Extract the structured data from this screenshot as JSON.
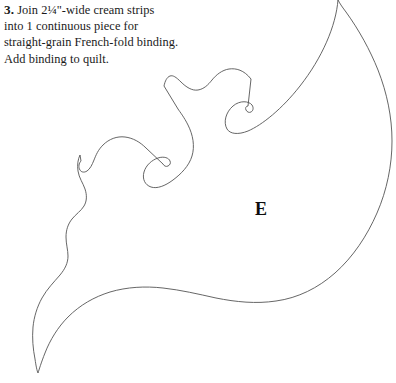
{
  "page": {
    "background_color": "#ffffff",
    "width": 396,
    "height": 383
  },
  "instructions": {
    "step_number": "3.",
    "lines": [
      " Join 2¼\"-wide cream strips",
      "into 1 continuous piece for",
      "straight-grain French-fold binding.",
      "Add binding to quilt."
    ],
    "full_text": "3. Join 2¼\"-wide cream strips into 1 continuous piece for straight-grain French-fold binding. Add binding to quilt.",
    "text_color": "#1a1a1a"
  },
  "pattern": {
    "piece_label": "E",
    "label_color": "#0d0d0d",
    "outline_color": "#555555",
    "outline_width": "0.9",
    "fill": "none",
    "description": "appliqué pattern piece outline"
  }
}
